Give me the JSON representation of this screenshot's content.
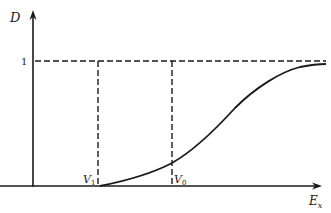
{
  "diagram": {
    "y_axis_label": "D",
    "x_axis_label_main": "E",
    "x_axis_label_sub": "x",
    "y_tick_label": "1",
    "markers": [
      {
        "main": "V",
        "sub": "1"
      },
      {
        "main": "V",
        "sub": "0"
      }
    ],
    "curve_description": "Sigmoid-like curve D(E_x) rising from 0 at V1 toward asymptote 1",
    "asymptote_value": "1"
  },
  "colors": {
    "ink": "#1a1a1a",
    "background": "#ffffff"
  }
}
